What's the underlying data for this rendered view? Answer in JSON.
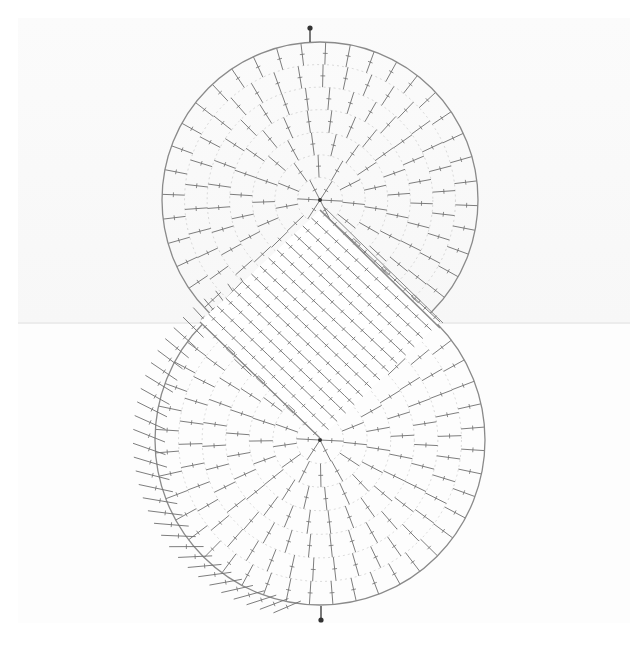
{
  "diagram": {
    "title": "",
    "type": "crochet-stitch-chart",
    "colors": {
      "stitch": "#6e6e6e",
      "outline": "#8a8a8a",
      "marker": "#333333",
      "background": "#ffffff",
      "show_through": "#f6f6f6"
    },
    "top_circle": {
      "cx": 320,
      "cy": 200,
      "r": 158,
      "rings": 7,
      "spokes": 40
    },
    "bottom_circle": {
      "cx": 320,
      "cy": 440,
      "r": 165,
      "rings": 7,
      "spokes": 44,
      "outer_ring_left": true
    },
    "band": {
      "corners": [
        [
          320,
          210
        ],
        [
          440,
          322
        ],
        [
          320,
          438
        ],
        [
          200,
          322
        ]
      ],
      "rows": 14,
      "stitches_per_row": 12
    },
    "markers": [
      {
        "name": "start-marker",
        "x": 310,
        "y": 28,
        "direction": "down"
      },
      {
        "name": "end-marker",
        "x": 321,
        "y": 620,
        "direction": "up"
      }
    ]
  }
}
